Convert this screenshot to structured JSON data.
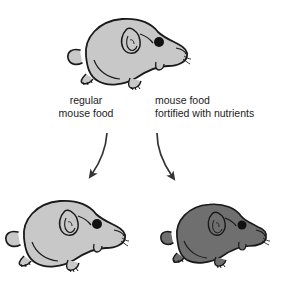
{
  "diagram": {
    "background_color": "#ffffff",
    "parent": {
      "name": "parent mouse",
      "body_color": "#c8c8c8",
      "outline_color": "#1a1a1a",
      "eye_color": "#111111",
      "facing": "right"
    },
    "branches": [
      {
        "id": "regular",
        "label_line_1": "regular",
        "label_line_2": "mouse food",
        "arrow": "curved-down-left",
        "offspring": {
          "name": "offspring mouse regular diet",
          "body_color": "#c8c8c8",
          "outline_color": "#1a1a1a",
          "eye_color": "#111111",
          "facing": "right"
        }
      },
      {
        "id": "fortified",
        "label_line_1": "mouse food",
        "label_line_2": "fortified with nutrients",
        "arrow": "curved-down-right",
        "offspring": {
          "name": "offspring mouse fortified diet",
          "body_color": "#6f6f6f",
          "outline_color": "#1a1a1a",
          "eye_color": "#111111",
          "facing": "right"
        }
      }
    ],
    "arrow_color": "#333333",
    "text_color": "#1c1c1c"
  }
}
